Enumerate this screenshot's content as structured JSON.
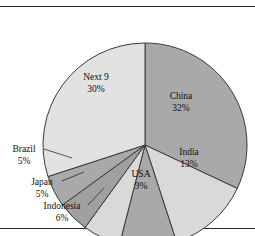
{
  "chart_data": {
    "type": "pie",
    "title": "",
    "subtitle": "",
    "xlabel": "",
    "ylabel": "",
    "legend_position": "none",
    "grid": false,
    "start_angle_deg": 0,
    "direction": "clockwise",
    "units": "percent",
    "total": 100,
    "categories": [
      "China",
      "India",
      "USA",
      "Indonesia",
      "Japan",
      "Brazil",
      "Next 9"
    ],
    "values": [
      32,
      13,
      9,
      6,
      5,
      5,
      30
    ],
    "slices": [
      {
        "name": "China",
        "label": "China",
        "value": 32,
        "value_label": "32%",
        "color": "#a9a9a9",
        "label_placement": "inside",
        "label_x": 181,
        "label_y": 99,
        "value_x": 181,
        "value_y": 111
      },
      {
        "name": "India",
        "label": "India",
        "value": 13,
        "value_label": "13%",
        "color": "#d9d9d9",
        "label_placement": "inside",
        "label_x": 189,
        "label_y": 155,
        "value_x": 189,
        "value_y": 167
      },
      {
        "name": "USA",
        "label": "USA",
        "value": 9,
        "value_label": "9%",
        "color": "#a9a9a9",
        "label_placement": "inside",
        "label_x": 141,
        "label_y": 177,
        "value_x": 141,
        "value_y": 189
      },
      {
        "name": "Indonesia",
        "label": "Indonesia",
        "value": 6,
        "value_label": "6%",
        "color": "#d9d9d9",
        "label_placement": "outside",
        "label_x": 62,
        "label_y": 209,
        "value_x": 62,
        "value_y": 221,
        "leader": {
          "x1": 88,
          "y1": 205,
          "x2": 104,
          "y2": 188
        }
      },
      {
        "name": "Japan",
        "label": "Japan",
        "value": 5,
        "value_label": "5%",
        "color": "#a0a0a0",
        "label_placement": "outside",
        "label_x": 42,
        "label_y": 185,
        "value_x": 42,
        "value_y": 197,
        "leader": {
          "x1": 62,
          "y1": 181,
          "x2": 84,
          "y2": 172
        }
      },
      {
        "name": "Brazil",
        "label": "Brazil",
        "value": 5,
        "value_label": "5%",
        "color": "#a9a9a9",
        "label_placement": "outside",
        "label_x": 24,
        "label_y": 152,
        "value_x": 24,
        "value_y": 164,
        "leader": {
          "x1": 44,
          "y1": 149,
          "x2": 72,
          "y2": 158
        }
      },
      {
        "name": "Next 9",
        "label": "Next 9",
        "value": 30,
        "value_label": "30%",
        "color": "#e2e2e2",
        "label_placement": "inside",
        "label_x": 96,
        "label_y": 80,
        "value_x": 96,
        "value_y": 92
      }
    ],
    "geometry": {
      "center_x": 145,
      "center_y": 145,
      "radius": 102
    },
    "colors": {
      "outline": "#3a3a3a",
      "text": "#101010",
      "background": "#ffffff",
      "rule": "#2a2a2a"
    }
  }
}
